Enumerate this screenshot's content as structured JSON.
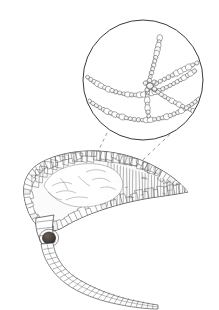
{
  "figure": {
    "caption": "",
    "background_color": "#ffffff",
    "ink_color": "#3a3a3a",
    "light_ink_color": "#6b6b6b",
    "bead_fill_color": "#e8e8e8",
    "body_fill_color": "#fbfbfb",
    "eyespot_color": "#3a3330",
    "width": 219,
    "height": 310
  },
  "inset": {
    "label": "magnified-detail-circle",
    "center_x": 143,
    "center_y": 80,
    "radius": 60,
    "stroke_width": 1.0,
    "content_description": "beaded filament chains forming a branched junction",
    "chains": [
      {
        "name": "upper-chain",
        "path": "M 86 76 C 100 87, 118 95, 136 95 C 154 95, 172 86, 196 70",
        "bead_count": 30
      },
      {
        "name": "lower-chain",
        "path": "M 88 100 C 104 112, 126 121, 148 120 C 168 119, 186 110, 200 98",
        "bead_count": 30
      },
      {
        "name": "vertical-branch",
        "path": "M 160 36 C 158 50, 154 64, 150 78 C 147 90, 146 104, 149 118",
        "bead_count": 21
      },
      {
        "name": "upper-right-branch",
        "path": "M 150 86 C 164 80, 180 71, 199 62",
        "bead_count": 12
      },
      {
        "name": "lower-right-branch",
        "path": "M 150 86 C 162 96, 176 104, 196 112",
        "bead_count": 13
      }
    ],
    "junction": {
      "name": "chain-junction",
      "x": 150,
      "y": 86
    }
  },
  "leader_lines": [
    {
      "name": "left-leader-line",
      "x1": 107,
      "y1": 133,
      "x2": 90,
      "y2": 168,
      "style": "dashed"
    },
    {
      "name": "right-leader-line",
      "x1": 180,
      "y1": 125,
      "x2": 131,
      "y2": 171,
      "style": "dashed"
    }
  ],
  "organism": {
    "name": "body-outline",
    "common_parts": [
      "carapace",
      "eyespot",
      "segmented-tail"
    ],
    "outline_path": "M 24 196 C 22 182, 28 170, 40 163 C 56 154, 78 150, 98 151 C 118 152, 136 157, 152 165 C 168 173, 180 182, 188 192 C 178 194, 164 196, 150 198 C 132 201, 112 206, 96 212 C 82 217, 70 223, 62 228 C 54 232, 46 232, 40 228 C 32 222, 26 210, 24 196 Z",
    "eyespot": {
      "name": "eyespot",
      "cx": 49,
      "cy": 238,
      "rx": 6.5,
      "ry": 6.0,
      "color": "#3a3330"
    },
    "tail": {
      "name": "segmented-tail-filament",
      "path_upper": "M 42 244 C 44 258, 52 272, 66 283 C 82 295, 104 302, 128 306 C 140 308, 150 309, 158 309",
      "path_lower": "M 52 243 C 54 256, 62 268, 76 277 C 92 287, 114 295, 136 300 C 146 302, 154 304, 158 305",
      "segment_count": 26
    },
    "neck": {
      "name": "neck-region",
      "path": "M 36 218 C 36 226, 38 234, 42 243 L 54 242 C 52 233, 52 224, 54 216 Z"
    }
  }
}
